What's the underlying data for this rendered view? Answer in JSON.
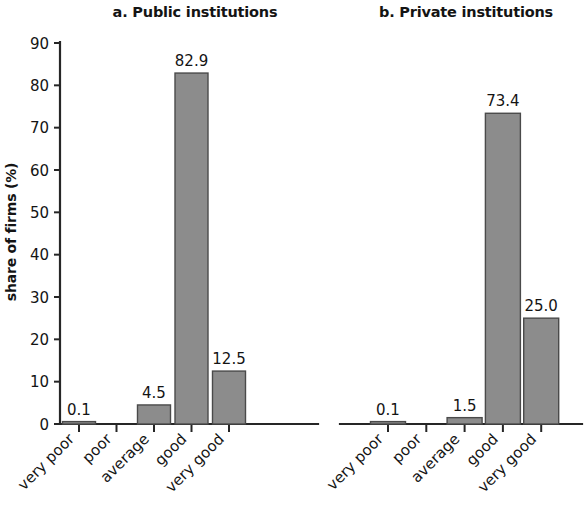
{
  "chart_data": {
    "type": "bar",
    "title": "",
    "categories": [
      "very poor",
      "poor",
      "average",
      "good",
      "very good"
    ],
    "xlabel": "",
    "ylabel": "share of firms (%)",
    "ylim": [
      0,
      90
    ],
    "ytick_step": 10,
    "yticks": [
      "0",
      "10",
      "20",
      "30",
      "40",
      "50",
      "60",
      "70",
      "80",
      "90"
    ],
    "grid": false,
    "legend": "none",
    "bar_color": "#8c8c8c",
    "bar_edge_color": "#4a4a4a",
    "axis_color": "#262626",
    "panels": [
      {
        "id": "panel-a",
        "title": "a. Public institutions",
        "categories": [
          "very poor",
          "poor",
          "average",
          "good",
          "very good"
        ],
        "values": [
          0.1,
          0.0,
          4.5,
          82.9,
          12.5
        ],
        "value_labels": [
          "0.1",
          "",
          "4.5",
          "82.9",
          "12.5"
        ],
        "has_y_axis": true
      },
      {
        "id": "panel-b",
        "title": "b. Private institutions",
        "categories": [
          "very poor",
          "poor",
          "average",
          "good",
          "very good"
        ],
        "values": [
          0.1,
          0.0,
          1.5,
          73.4,
          25.0
        ],
        "value_labels": [
          "0.1",
          "",
          "1.5",
          "73.4",
          "25.0"
        ],
        "has_y_axis": false
      }
    ]
  },
  "figure": {
    "panel_a_title": "a. Public institutions",
    "panel_b_title": "b. Private institutions",
    "y_axis_label": "share of firms (%)"
  }
}
